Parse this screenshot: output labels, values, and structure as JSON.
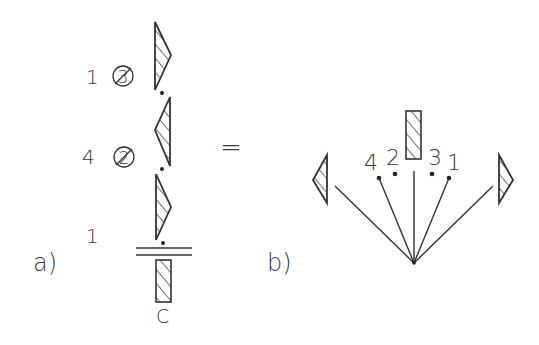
{
  "colors": {
    "ink": "#333333",
    "background": "#ffffff"
  },
  "panel_a": {
    "label": "a)",
    "rows": [
      {
        "multiplier": "1",
        "circled_number": "3",
        "struck_through": true
      },
      {
        "multiplier": "4",
        "circled_number": "2",
        "struck_through": true
      },
      {
        "multiplier": "1",
        "circled_number": "",
        "struck_through": false
      }
    ],
    "bottom_element_label": "C"
  },
  "equals": "=",
  "panel_b": {
    "label": "b)",
    "point_labels": [
      "4",
      "2",
      "3",
      "1"
    ]
  }
}
